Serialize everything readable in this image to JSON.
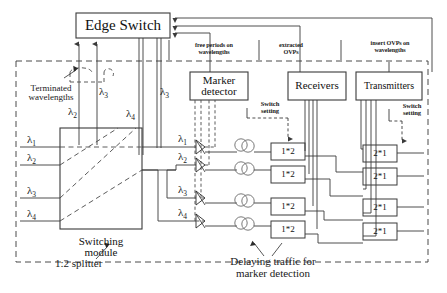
{
  "figure": {
    "type": "network-architecture-diagram"
  },
  "colors": {
    "line": "#3a3a3a",
    "dashed": "#4a4a4a",
    "text": "#111111",
    "background": "#ffffff"
  },
  "blocks": {
    "edge_switch": "Edge Switch",
    "switching_module_line1": "Switching",
    "switching_module_line2": "module",
    "marker_detector_line1": "Marker",
    "marker_detector_line2": "detector",
    "receivers": "Receivers",
    "transmitters": "Transmitters"
  },
  "annotations": {
    "terminated_line1": "Terminated",
    "terminated_line2": "wavelengths",
    "free_periods_line1": "free periods on",
    "free_periods_line2": "wavelengths",
    "extracted_line1": "extracted",
    "extracted_line2": "OVPs",
    "insert_line1": "insert OVPs on",
    "insert_line2": "wavelengths",
    "switch_setting_line1": "Switch",
    "switch_setting_line2": "setting",
    "splitter": "1:2 splitter",
    "delaying_line1": "Delaying traffic for",
    "delaying_line2": "marker detection"
  },
  "wavelengths": {
    "input_ports": [
      "λ",
      "λ",
      "λ",
      "λ"
    ],
    "input_subs": [
      "1",
      "2",
      "3",
      "4"
    ],
    "mid_ports": [
      "λ",
      "λ",
      "λ",
      "λ"
    ],
    "mid_subs": [
      "1",
      "2",
      "3",
      "4"
    ],
    "terminated": [
      "λ",
      "λ"
    ],
    "terminated_subs": [
      "2",
      "3"
    ],
    "upper_labels": [
      "λ",
      "λ",
      "λ"
    ],
    "upper_subs": [
      "2",
      "3",
      "4"
    ],
    "edge_feed": "λ",
    "edge_feed_sub": "3"
  },
  "switches": {
    "receiver_side_label": "1*2",
    "transmitter_side_label": "2*1",
    "receiver_side_count": 4,
    "transmitter_side_count": 4
  }
}
